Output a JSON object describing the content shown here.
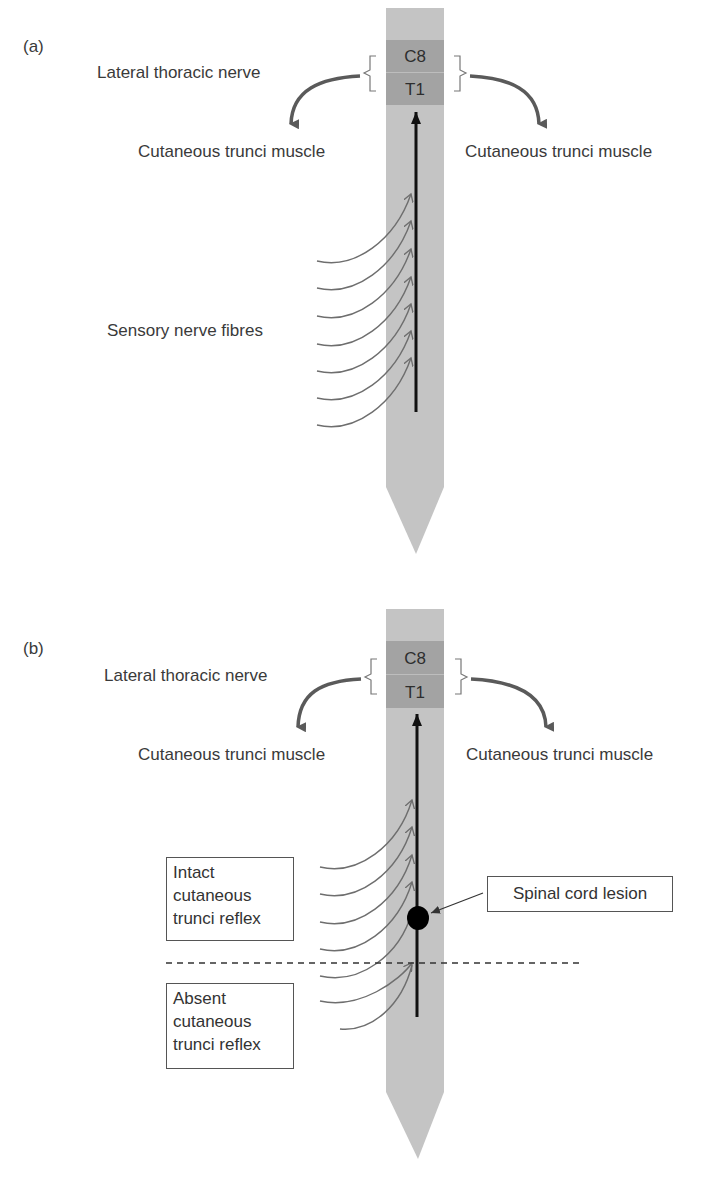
{
  "figure": {
    "colors": {
      "cord": "#c4c4c4",
      "segment": "#a3a3a3",
      "nerve_arrow": "#5a5a5a",
      "fibre": "#6e6e6e",
      "tract": "#111111",
      "lesion": "#000000"
    },
    "panels": [
      {
        "id": "a",
        "panel_label": "(a)",
        "segments": [
          "C8",
          "T1"
        ],
        "nerve_label": "Lateral thoracic nerve",
        "left_target": "Cutaneous trunci muscle",
        "right_target": "Cutaneous trunci muscle",
        "fibres_label": "Sensory nerve fibres",
        "fibre_count": 7
      },
      {
        "id": "b",
        "panel_label": "(b)",
        "segments": [
          "C8",
          "T1"
        ],
        "nerve_label": "Lateral thoracic nerve",
        "left_target": "Cutaneous trunci muscle",
        "right_target": "Cutaneous trunci muscle",
        "fibre_count": 7,
        "intact_box": [
          "Intact",
          "cutaneous",
          "trunci reflex"
        ],
        "absent_box": [
          "Absent",
          "cutaneous",
          "trunci reflex"
        ],
        "lesion_label": "Spinal cord lesion"
      }
    ]
  }
}
